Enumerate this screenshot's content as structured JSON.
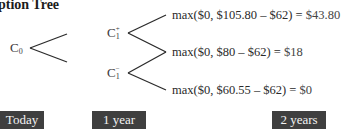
{
  "title": "ption Tree",
  "nodes": {
    "c0": {
      "base": "C",
      "sub": "0",
      "sup": ""
    },
    "c1_up": {
      "base": "C",
      "sub": "1",
      "sup": "+"
    },
    "c1_down": {
      "base": "C",
      "sub": "1",
      "sup": "−"
    }
  },
  "payoffs": [
    {
      "expr": "max($0, $105.80 – $62) = ",
      "result": "$43.80"
    },
    {
      "expr": "max($0, $80 – $62) = ",
      "result": "$18"
    },
    {
      "expr": "max($0, $60.55 – $62) = ",
      "result": "$0"
    }
  ],
  "timeline": [
    {
      "label": "Today"
    },
    {
      "label": "1 year"
    },
    {
      "label": "2 years"
    }
  ],
  "colors": {
    "line": "#2b2b2b",
    "label_bg": "#3f3f3f",
    "label_text": "#f2f2f2"
  }
}
